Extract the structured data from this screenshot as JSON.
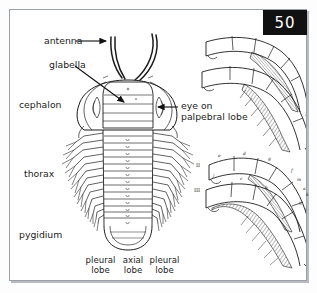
{
  "figure": {
    "page_number": "50",
    "frame_color": "#9aa0a6",
    "badge_bg": "#111111",
    "badge_fg": "#ffffff",
    "ink_color": "#1c1c1c"
  },
  "labels": {
    "antenna": "antenna",
    "glabella": "glabella",
    "cephalon": "cephalon",
    "eye_on_palpebral_lobe": "eye on\npalpebral lobe",
    "thorax": "thorax",
    "pygidium": "pygidium",
    "pleural_lobe_left": "pleural\nlobe",
    "axial_lobe": "axial\nlobe",
    "pleural_lobe_right": "pleural\nlobe"
  },
  "limb_figures": {
    "upper": {
      "name": "appendage-detail-upper",
      "caption": ""
    },
    "lower": {
      "name": "appendage-detail-lower",
      "numeral_two": "II",
      "numeral_three": "III",
      "annotations": [
        "e",
        "d",
        "g",
        "j",
        "i",
        "c",
        "f",
        "m",
        "a",
        "b",
        "h",
        "k"
      ]
    }
  }
}
